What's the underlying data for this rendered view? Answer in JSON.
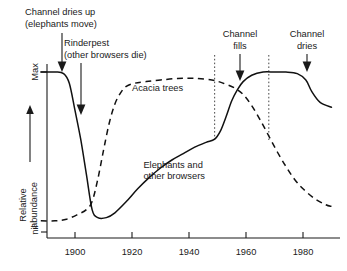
{
  "chart_data": {
    "type": "line",
    "title": "",
    "xlabel": "",
    "ylabel": "Relative abundance",
    "xlim": [
      1888,
      1990
    ],
    "ylim": [
      0,
      1
    ],
    "grid": false,
    "legend_position": "inline-labels",
    "x_ticks": [
      1900,
      1920,
      1940,
      1960,
      1980
    ],
    "x_tick_labels": [
      "1900",
      "1920",
      "1940",
      "1960",
      "1980"
    ],
    "y_ticks": [
      0,
      1
    ],
    "y_tick_labels": [
      "nil",
      "Max"
    ],
    "y_axis_top_label": "Max",
    "y_axis_bottom_label": "nil",
    "series": [
      {
        "name": "Elephants and other browsers",
        "style": "solid",
        "x": [
          1888,
          1893,
          1896,
          1898,
          1900,
          1902,
          1904,
          1906,
          1908,
          1911,
          1914,
          1918,
          1922,
          1926,
          1930,
          1934,
          1938,
          1942,
          1946,
          1949,
          1951,
          1953,
          1955,
          1957,
          1959,
          1962,
          1966,
          1970,
          1974,
          1978,
          1981,
          1983,
          1986,
          1990
        ],
        "y": [
          1.0,
          1.0,
          0.99,
          0.93,
          0.76,
          0.58,
          0.36,
          0.14,
          0.09,
          0.09,
          0.12,
          0.19,
          0.27,
          0.34,
          0.4,
          0.45,
          0.49,
          0.53,
          0.56,
          0.58,
          0.63,
          0.72,
          0.82,
          0.89,
          0.94,
          0.98,
          1.0,
          1.0,
          1.0,
          0.99,
          0.95,
          0.88,
          0.81,
          0.78
        ]
      },
      {
        "name": "Acacia trees",
        "style": "dashed",
        "x": [
          1888,
          1893,
          1897,
          1901,
          1904,
          1906,
          1908,
          1910,
          1912,
          1914,
          1916,
          1918,
          1921,
          1925,
          1930,
          1936,
          1942,
          1948,
          1952,
          1956,
          1959,
          1962,
          1965,
          1968,
          1971,
          1974,
          1977,
          1980,
          1984,
          1988,
          1990
        ],
        "y": [
          0.07,
          0.07,
          0.08,
          0.11,
          0.14,
          0.19,
          0.33,
          0.51,
          0.68,
          0.8,
          0.87,
          0.91,
          0.93,
          0.94,
          0.95,
          0.96,
          0.96,
          0.95,
          0.93,
          0.9,
          0.86,
          0.79,
          0.7,
          0.6,
          0.5,
          0.41,
          0.33,
          0.27,
          0.21,
          0.17,
          0.16
        ]
      }
    ],
    "series_labels": [
      {
        "name": "acacia-trees-label",
        "text": "Acacia trees",
        "x": 1920,
        "y": 0.88
      },
      {
        "name": "elephants-label",
        "text": "Elephants and",
        "x": 1924,
        "y": 0.4
      },
      {
        "name": "elephants-label-2",
        "text": "other browsers",
        "x": 1924,
        "y": 0.33
      }
    ],
    "annotations": [
      {
        "name": "channel-dries-up",
        "lines": [
          "Channel dries up",
          "(elephants move)"
        ],
        "year": 1893,
        "target_y": 1.0
      },
      {
        "name": "rinderpest",
        "lines": [
          "Rinderpest",
          "(other browsers die)"
        ],
        "year": 1900,
        "target_y": 0.74
      },
      {
        "name": "channel-fills",
        "lines": [
          "Channel",
          "fills"
        ],
        "year": 1956,
        "target_y": 0.95
      },
      {
        "name": "channel-dries",
        "lines": [
          "Channel",
          "dries"
        ],
        "year": 1979,
        "target_y": 1.0
      }
    ],
    "event_lines": [
      {
        "name": "channel-fills-event",
        "year": 1949
      },
      {
        "name": "channel-dries-event",
        "year": 1968
      }
    ]
  }
}
